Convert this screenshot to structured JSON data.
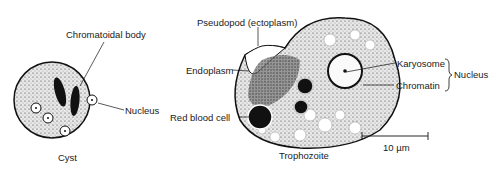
{
  "figure": {
    "cyst": {
      "caption": "Cyst",
      "labels": {
        "chromatoidal_body": "Chromatoidal body",
        "nucleus": "Nucleus"
      }
    },
    "trophozoite": {
      "caption": "Trophozoite",
      "labels": {
        "pseudopod": "Pseudopod (ectoplasm)",
        "endoplasm": "Endoplasm",
        "red_blood_cell": "Red blood cell",
        "karyosome": "Karyosome",
        "chromatin": "Chromatin",
        "nucleus_group": "Nucleus"
      }
    },
    "scale_bar": {
      "label": "10 µm"
    }
  }
}
